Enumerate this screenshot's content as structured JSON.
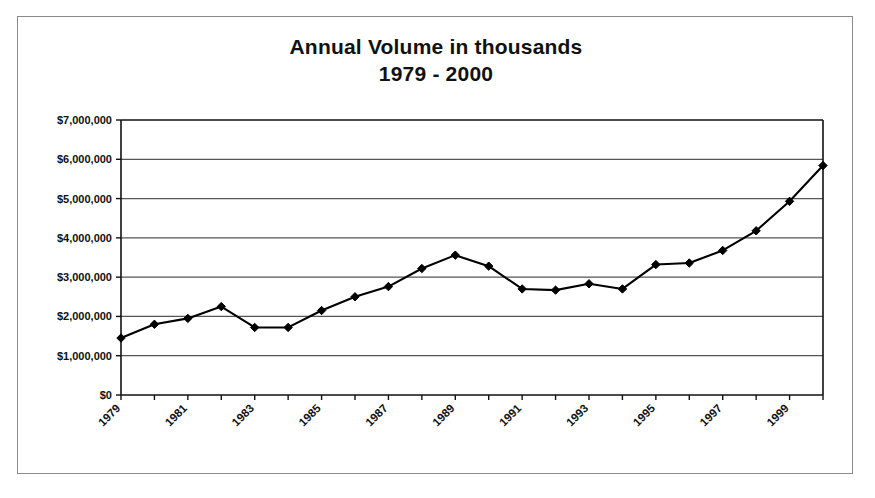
{
  "chart_data": {
    "type": "line",
    "title": "Annual Volume in thousands",
    "subtitle": "1979 - 2000",
    "title_line1": "Annual Volume in thousands",
    "title_line2": "1979 - 2000",
    "xlabel": "",
    "ylabel": "",
    "ylim": [
      0,
      7000000
    ],
    "ytick_values": [
      0,
      1000000,
      2000000,
      3000000,
      4000000,
      5000000,
      6000000,
      7000000
    ],
    "ytick_labels": [
      "$0",
      "$1,000,000",
      "$2,000,000",
      "$3,000,000",
      "$4,000,000",
      "$5,000,000",
      "$6,000,000",
      "$7,000,000"
    ],
    "xtick_labels": [
      "1979",
      "1981",
      "1983",
      "1985",
      "1987",
      "1989",
      "1991",
      "1993",
      "1995",
      "1997",
      "1999"
    ],
    "x": [
      1979,
      1980,
      1981,
      1982,
      1983,
      1984,
      1985,
      1986,
      1987,
      1988,
      1989,
      1990,
      1991,
      1992,
      1993,
      1994,
      1995,
      1996,
      1997,
      1998,
      1999,
      2000
    ],
    "values": [
      1450000,
      1800000,
      1950000,
      2250000,
      1720000,
      1720000,
      2150000,
      2500000,
      2760000,
      3220000,
      3560000,
      3280000,
      2700000,
      2670000,
      2830000,
      2700000,
      3320000,
      3360000,
      3680000,
      4180000,
      4930000,
      5840000
    ],
    "grid": true,
    "grid_axis": "y",
    "legend": false,
    "legend_position": "none",
    "marker": "diamond",
    "line_color": "#000000",
    "marker_color": "#000000",
    "grid_color": "#555555",
    "axis_color": "#111111",
    "background_color": "#ffffff"
  }
}
